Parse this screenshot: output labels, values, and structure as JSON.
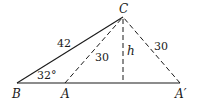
{
  "diagram": {
    "type": "geometry-triangle",
    "points": {
      "B": {
        "label": "B",
        "x": 17,
        "y": 83
      },
      "A": {
        "label": "A",
        "x": 65,
        "y": 83
      },
      "A_prime": {
        "label": "A′",
        "x": 180,
        "y": 83
      },
      "C": {
        "label": "C",
        "x": 123,
        "y": 17
      },
      "H": {
        "x": 123,
        "y": 83
      }
    },
    "segments": [
      {
        "from": "B",
        "to": "C",
        "style": "solid",
        "label": "42"
      },
      {
        "from": "B",
        "to": "A_prime",
        "style": "solid",
        "label": ""
      },
      {
        "from": "A",
        "to": "C",
        "style": "dashed",
        "label": "30"
      },
      {
        "from": "A_prime",
        "to": "C",
        "style": "dashed",
        "label": "30"
      },
      {
        "from": "C",
        "to": "H",
        "style": "dashed",
        "label": "h"
      }
    ],
    "angle": {
      "vertex": "B",
      "label": "32°"
    },
    "labels": {
      "B": "B",
      "A": "A",
      "A_prime": "A′",
      "C": "C",
      "h": "h",
      "side_BC": "42",
      "side_AC": "30",
      "side_ApC": "30",
      "angle_B": "32°"
    }
  }
}
